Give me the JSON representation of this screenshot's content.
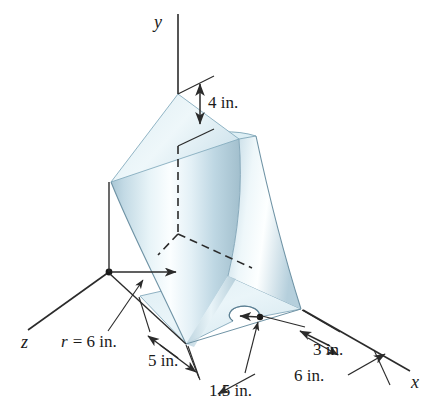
{
  "figure": {
    "background_color": "#ffffff",
    "line_color": "#2b2b2b",
    "surface_colors": {
      "shell_light": "#f4fafc",
      "shell_mid": "#cfe2ea",
      "shell_dark": "#a8c4d2",
      "plate_light": "#eef6f9",
      "plate_mid": "#d2e4ec",
      "top_face": "#dfeef4"
    }
  },
  "axes": [
    {
      "name": "y-axis",
      "label": "y",
      "direction": "up"
    },
    {
      "name": "x-axis",
      "label": "x",
      "direction": "down-right"
    },
    {
      "name": "z-axis",
      "label": "z",
      "direction": "down-left"
    }
  ],
  "dimensions": [
    {
      "name": "height-dimension",
      "label": "4 in.",
      "value": 4,
      "unit": "in."
    },
    {
      "name": "radius-dimension",
      "label": "r = 6 in.",
      "symbol": "r",
      "equals": "=",
      "value": 6,
      "unit": "in."
    },
    {
      "name": "plate-width-dimension",
      "label": "5 in.",
      "value": 5,
      "unit": "in."
    },
    {
      "name": "notch-radius-dimension",
      "label": "1.5 in.",
      "value": 1.5,
      "unit": "in."
    },
    {
      "name": "notch-offset-dimension",
      "label": "3 in.",
      "value": 3,
      "unit": "in."
    },
    {
      "name": "plate-length-dimension",
      "label": "6 in.",
      "value": 6,
      "unit": "in."
    }
  ],
  "labels": {
    "y_axis": "y",
    "x_axis": "x",
    "z_axis": "z",
    "four_in": "4 in.",
    "r_symbol": "r",
    "r_equals": "= 6 in.",
    "r_full": "r = 6 in.",
    "five_in": "5 in.",
    "one_point_five_in": "1.5 in.",
    "three_in": "3 in.",
    "six_in": "6 in."
  }
}
